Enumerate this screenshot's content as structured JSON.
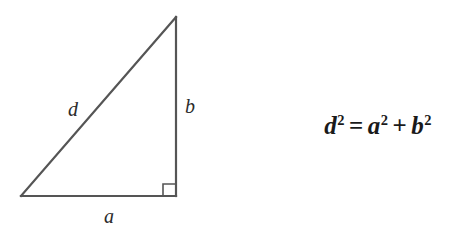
{
  "figure": {
    "kind": "right-triangle-pythagorean-diagram",
    "background_color": "#ffffff",
    "stroke_color": "#555555"
  },
  "diagram": {
    "labels": {
      "hypotenuse": "d",
      "vertical_leg": "b",
      "horizontal_leg": "a"
    },
    "right_angle_marker": "right-angle-square",
    "vertices": {
      "apex": [
        176,
        17
      ],
      "bottom_left": [
        21,
        196
      ],
      "bottom_right": [
        176,
        196
      ]
    }
  },
  "equation": {
    "full": "d² = a² + b²",
    "lhs_base": "d",
    "lhs_exponent": "2",
    "equals": "=",
    "term1_base": "a",
    "term1_exponent": "2",
    "plus": "+",
    "term2_base": "b",
    "term2_exponent": "2"
  }
}
